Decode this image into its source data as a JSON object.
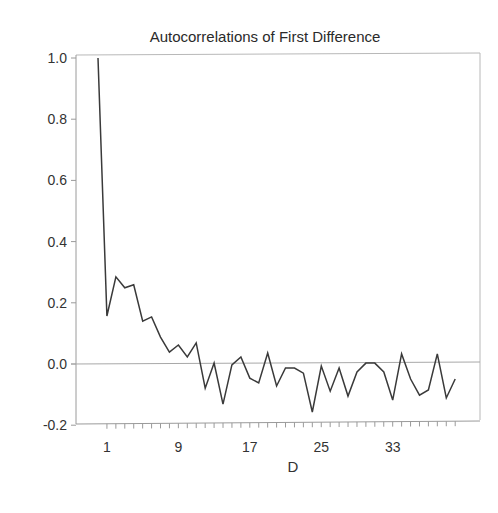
{
  "chart_data": {
    "type": "line",
    "title": "Autocorrelations of First Difference",
    "xlabel": "D",
    "ylabel": "",
    "ylim": [
      -0.2,
      1.0
    ],
    "xlim": [
      0,
      40
    ],
    "grid": false,
    "reference_line": {
      "y": 0.0
    },
    "y_ticks": [
      1.0,
      0.8,
      0.6,
      0.4,
      0.2,
      0.0,
      -0.2
    ],
    "y_tick_labels": [
      "1.0",
      "0.8",
      "0.6",
      "0.4",
      "0.2",
      "0.0",
      "-0.2"
    ],
    "x_tick_labels": [
      {
        "lag": 1,
        "label": "1"
      },
      {
        "lag": 9,
        "label": "9"
      },
      {
        "lag": 17,
        "label": "17"
      },
      {
        "lag": 25,
        "label": "25"
      },
      {
        "lag": 33,
        "label": "33"
      }
    ],
    "x_minor_ticks": {
      "from": 1,
      "to": 40,
      "step": 1
    },
    "x": [
      0,
      1,
      2,
      3,
      4,
      5,
      6,
      7,
      8,
      9,
      10,
      11,
      12,
      13,
      14,
      15,
      16,
      17,
      18,
      19,
      20,
      21,
      22,
      23,
      24,
      25,
      26,
      27,
      28,
      29,
      30,
      31,
      32,
      33,
      34,
      35,
      36,
      37,
      38,
      39,
      40
    ],
    "series": [
      {
        "name": "Autocorrelation",
        "values": [
          1.0,
          0.157,
          0.285,
          0.249,
          0.259,
          0.14,
          0.154,
          0.088,
          0.039,
          0.062,
          0.023,
          0.069,
          -0.079,
          0.003,
          -0.131,
          -0.003,
          0.023,
          -0.046,
          -0.062,
          0.036,
          -0.072,
          -0.013,
          -0.013,
          -0.03,
          -0.157,
          -0.007,
          -0.089,
          -0.013,
          -0.105,
          -0.026,
          0.003,
          0.003,
          -0.026,
          -0.118,
          0.033,
          -0.049,
          -0.102,
          -0.085,
          0.033,
          -0.111,
          -0.049
        ],
        "color": "#3a3a3a"
      }
    ]
  },
  "layout": {
    "plot_left": 76,
    "plot_right": 480,
    "plot_top": 55,
    "plot_bottom": 424,
    "lag0_x": 98,
    "lag_spacing": 8.93,
    "y_zero_px": 364,
    "y_per_unit": 306
  }
}
